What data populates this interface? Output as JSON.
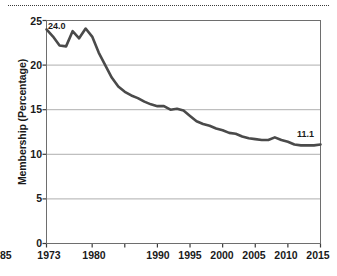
{
  "chart_data": {
    "type": "line",
    "title": "",
    "xlabel": "",
    "ylabel": "Membership (Percentage)",
    "xlim": [
      1973,
      2015
    ],
    "ylim": [
      0,
      25
    ],
    "grid": true,
    "legend": "none",
    "y_ticks": [
      0,
      5,
      10,
      15,
      20,
      25
    ],
    "y_tick_labels": [
      "0",
      "5",
      "10",
      "15",
      "20",
      "25"
    ],
    "x_ticks": [
      1973,
      1980,
      1985,
      1990,
      1995,
      2000,
      2005,
      2010,
      2015
    ],
    "x_tick_labels": [
      "1973",
      "1980",
      "1985",
      "1990",
      "1995",
      "2000",
      "2005",
      "2010",
      "2015"
    ],
    "line_color": "#4a4a4a",
    "annotations": [
      {
        "text": "24.0",
        "x": 1973,
        "y": 24.0
      },
      {
        "text": "11.1",
        "x": 2015,
        "y": 11.1
      }
    ],
    "x": [
      1973,
      1974,
      1975,
      1976,
      1977,
      1978,
      1979,
      1980,
      1981,
      1982,
      1983,
      1984,
      1985,
      1986,
      1987,
      1988,
      1989,
      1990,
      1991,
      1992,
      1993,
      1994,
      1995,
      1996,
      1997,
      1998,
      1999,
      2000,
      2001,
      2002,
      2003,
      2004,
      2005,
      2006,
      2007,
      2008,
      2009,
      2010,
      2011,
      2012,
      2013,
      2014,
      2015
    ],
    "values": [
      24.0,
      23.2,
      22.2,
      22.1,
      23.8,
      23.0,
      24.1,
      23.2,
      21.4,
      20.0,
      18.6,
      17.6,
      17.0,
      16.6,
      16.3,
      15.9,
      15.6,
      15.4,
      15.4,
      15.0,
      15.1,
      14.9,
      14.3,
      13.7,
      13.4,
      13.2,
      12.9,
      12.7,
      12.4,
      12.3,
      12.0,
      11.8,
      11.7,
      11.6,
      11.6,
      11.9,
      11.6,
      11.4,
      11.1,
      11.0,
      11.0,
      11.0,
      11.1
    ],
    "series_name": "Union membership"
  },
  "decorations": {
    "top_rule": "dotted-separator"
  }
}
